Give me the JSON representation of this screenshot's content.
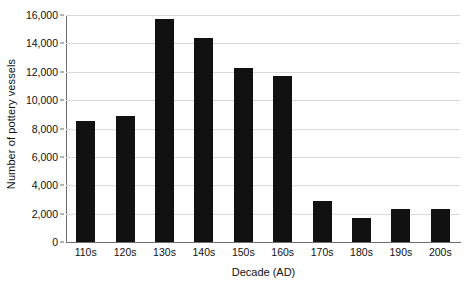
{
  "chart_data": {
    "type": "bar",
    "title": "",
    "xlabel": "Decade (AD)",
    "ylabel": "Number of pottery vessels",
    "categories": [
      "110s",
      "120s",
      "130s",
      "140s",
      "150s",
      "160s",
      "170s",
      "180s",
      "190s",
      "200s"
    ],
    "values": [
      8500,
      8850,
      15700,
      14350,
      12300,
      11700,
      2900,
      1700,
      2300,
      2300
    ],
    "ylim": [
      0,
      16000
    ],
    "ytick_values": [
      0,
      2000,
      4000,
      6000,
      8000,
      10000,
      12000,
      14000,
      16000
    ],
    "ytick_labels": [
      "0",
      "2,000",
      "4,000",
      "6,000",
      "8,000",
      "10,000",
      "12,000",
      "14,000",
      "16,000"
    ],
    "grid": true,
    "grid_axis": "y",
    "legend": false,
    "legend_position": "none",
    "bar_color": "#111111",
    "grid_color": "#d9d9d9",
    "axis_color": "#6d6d6d",
    "background": "#ffffff"
  }
}
